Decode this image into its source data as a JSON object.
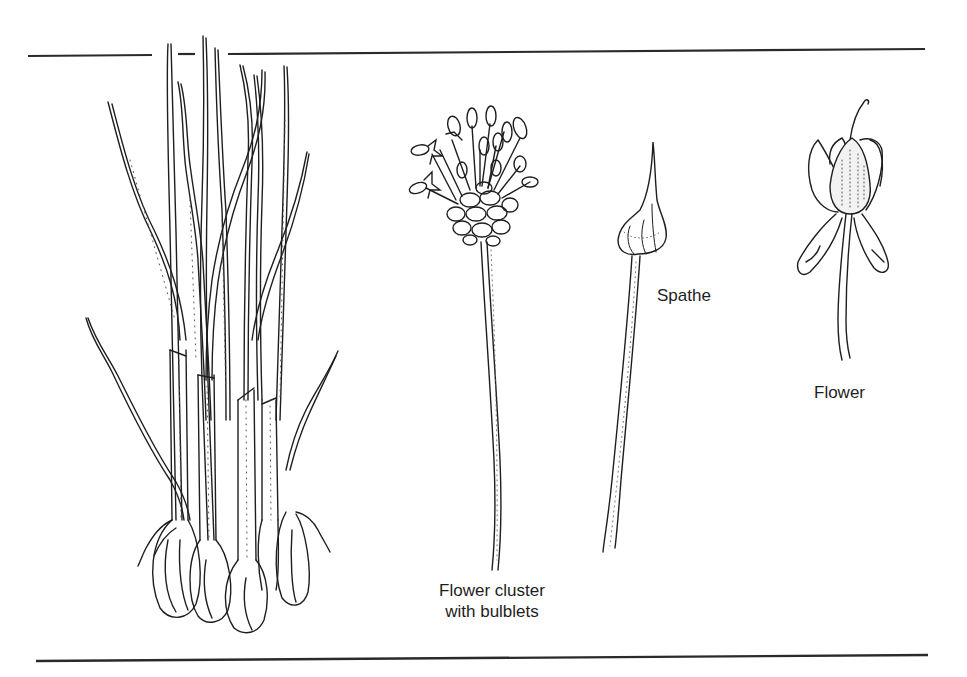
{
  "figure": {
    "colors": {
      "ink": "#1e1e1e",
      "rule": "#2a2a2a",
      "background": "#ffffff"
    },
    "rules": {
      "top": {
        "y": 52,
        "x_start": 28,
        "x_end": 925
      },
      "bottom": {
        "y": 657,
        "x_start": 36,
        "x_end": 928
      }
    },
    "labels": [
      {
        "id": "flower-cluster",
        "lines": [
          "Flower cluster",
          "with bulblets"
        ],
        "x": 492,
        "y": 580
      },
      {
        "id": "spathe",
        "lines": [
          "Spathe"
        ],
        "x": 655,
        "y": 286
      },
      {
        "id": "flower",
        "lines": [
          "Flower"
        ],
        "x": 813,
        "y": 382
      }
    ],
    "parts": [
      {
        "name": "plant-with-bulbs",
        "description": "Clump of tall leaves rising from bulbs"
      },
      {
        "name": "flower-cluster",
        "description": "Umbel of flowers with bulblets on long scape"
      },
      {
        "name": "spathe",
        "description": "Pointed papery spathe on long stalk"
      },
      {
        "name": "flower",
        "description": "Single flower with tepals and ovary"
      }
    ]
  }
}
